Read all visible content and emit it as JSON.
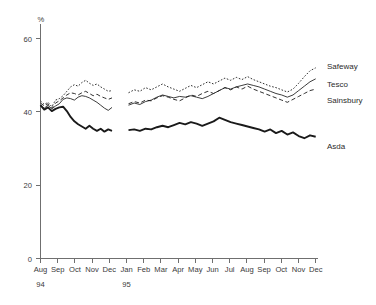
{
  "chart_data": {
    "type": "line",
    "title": "",
    "xlabel": "",
    "ylabel": "%",
    "ylim": [
      0,
      65
    ],
    "yticks": [
      0,
      20,
      40,
      60
    ],
    "ytick_labels": [
      "0",
      "20",
      "40",
      "60"
    ],
    "grid": false,
    "legend_position": "right-inline",
    "unit_label": "%",
    "x_categories": [
      "Aug",
      "Sep",
      "Oct",
      "Nov",
      "Dec",
      "Jan",
      "Feb",
      "Mar",
      "Apr",
      "May",
      "Jun",
      "Jul",
      "Aug",
      "Sep",
      "Oct",
      "Nov",
      "Dec"
    ],
    "year_markers": [
      {
        "label": "94",
        "at_category": "Aug"
      },
      {
        "label": "95",
        "at_category": "Jan"
      }
    ],
    "series": [
      {
        "name": "Safeway",
        "style": "dotted",
        "label": "Safeway",
        "values_segment_1": [
          43.0,
          42.0,
          42.6,
          41.4,
          43.2,
          43.6,
          44.4,
          45.6,
          46.8,
          47.4,
          47.0,
          48.0,
          48.6,
          47.8,
          47.2,
          47.6,
          46.8,
          46.2,
          45.6,
          45.8
        ],
        "values_segment_2": [
          45.2,
          46.0,
          45.6,
          46.6,
          46.0,
          46.8,
          47.6,
          46.8,
          46.2,
          45.6,
          46.4,
          47.2,
          46.6,
          47.4,
          48.2,
          47.6,
          48.4,
          49.2,
          48.6,
          49.4,
          48.8,
          49.6,
          48.8,
          48.2,
          47.6,
          47.0,
          46.6,
          46.0,
          45.4,
          46.2,
          47.8,
          49.6,
          51.2,
          52.0
        ]
      },
      {
        "name": "Tesco",
        "style": "solid-thin",
        "label": "Tesco",
        "values_segment_1": [
          41.6,
          41.0,
          41.8,
          40.8,
          41.6,
          42.2,
          43.4,
          43.8,
          43.6,
          43.2,
          44.0,
          44.4,
          44.2,
          43.8,
          43.2,
          42.6,
          41.8,
          41.0,
          40.4,
          41.2
        ],
        "values_segment_2": [
          41.8,
          42.4,
          42.0,
          42.8,
          43.2,
          44.0,
          44.6,
          44.2,
          43.8,
          44.2,
          44.0,
          44.4,
          44.0,
          43.6,
          44.2,
          45.0,
          45.8,
          46.6,
          46.2,
          46.8,
          47.2,
          47.6,
          47.2,
          46.8,
          46.2,
          45.6,
          45.0,
          44.6,
          44.0,
          44.6,
          45.8,
          47.0,
          48.2,
          49.0
        ]
      },
      {
        "name": "Sainsbury",
        "style": "dashed",
        "label": "Sainsbury",
        "values_segment_1": [
          42.4,
          41.6,
          42.2,
          41.0,
          42.4,
          43.0,
          43.8,
          44.6,
          45.2,
          45.0,
          44.6,
          45.2,
          45.6,
          45.0,
          44.4,
          44.8,
          44.2,
          43.8,
          43.4,
          43.8
        ],
        "values_segment_2": [
          42.2,
          42.8,
          42.4,
          43.2,
          43.0,
          43.8,
          44.4,
          44.0,
          43.4,
          43.0,
          43.8,
          44.6,
          44.2,
          45.0,
          45.6,
          45.0,
          45.8,
          46.6,
          46.0,
          46.8,
          46.2,
          47.0,
          46.2,
          45.6,
          45.0,
          44.4,
          43.8,
          43.2,
          42.6,
          43.4,
          44.2,
          45.0,
          45.8,
          46.2
        ]
      },
      {
        "name": "Asda",
        "style": "solid-thick",
        "label": "Asda",
        "values_segment_1": [
          41.8,
          40.6,
          41.2,
          40.2,
          40.8,
          41.2,
          41.4,
          40.2,
          38.6,
          37.4,
          36.6,
          36.0,
          35.4,
          36.2,
          35.4,
          34.8,
          35.4,
          34.6,
          35.2,
          34.8
        ],
        "values_segment_2": [
          35.0,
          35.2,
          34.8,
          35.4,
          35.2,
          35.8,
          36.2,
          35.8,
          36.4,
          37.0,
          36.6,
          37.2,
          36.8,
          36.2,
          36.8,
          37.4,
          38.4,
          37.8,
          37.2,
          36.8,
          36.4,
          36.0,
          35.6,
          35.2,
          34.6,
          35.2,
          34.2,
          34.8,
          33.8,
          34.4,
          33.4,
          32.8,
          33.6,
          33.2
        ]
      }
    ],
    "break_note": "series interrupted between Dec 94 and Jan 95"
  },
  "colors": {
    "axis": "#6f6f6f",
    "line": "#1a1a1a",
    "text": "#2b2b2b",
    "background": "#ffffff"
  }
}
